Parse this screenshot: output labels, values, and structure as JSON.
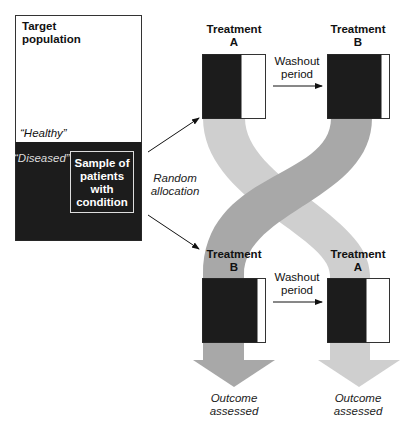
{
  "diagram": {
    "population": {
      "title": "Target population",
      "healthy_label": "“Healthy”",
      "diseased_label": "“Diseased”",
      "sample_label_lines": [
        "Sample of",
        "patients",
        "with",
        "condition"
      ]
    },
    "allocation": {
      "label_lines": [
        "Random",
        "allocation"
      ]
    },
    "arm_top": {
      "first": {
        "label_line1": "Treatment",
        "label_line2": "A"
      },
      "washout": {
        "label_line1": "Washout",
        "label_line2": "period"
      },
      "second": {
        "label_line1": "Treatment",
        "label_line2": "B"
      }
    },
    "arm_bottom": {
      "first": {
        "label_line1": "Treatment",
        "label_line2": "B"
      },
      "washout": {
        "label_line1": "Washout",
        "label_line2": "period"
      },
      "second": {
        "label_line1": "Treatment",
        "label_line2": "A"
      }
    },
    "outcomes": {
      "left": {
        "line1": "Outcome",
        "line2": "assessed"
      },
      "right": {
        "line1": "Outcome",
        "line2": "assessed"
      }
    },
    "colors": {
      "dark_fill": "#1c1c1c",
      "band_dark": "#a8a8a8",
      "band_light": "#cfcfcf",
      "outline": "#333333"
    }
  }
}
